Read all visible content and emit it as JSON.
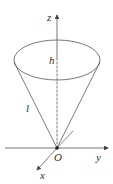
{
  "diagram": {
    "type": "cone-in-3d-axes",
    "labels": {
      "z_axis": "z",
      "y_axis": "y",
      "x_axis": "x",
      "origin": "O",
      "height": "h",
      "slant": "l"
    },
    "colors": {
      "line": "#555555",
      "text": "#333333",
      "background": "#ffffff"
    }
  }
}
